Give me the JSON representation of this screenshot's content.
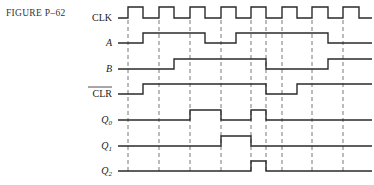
{
  "figure": {
    "label": "FIGURE P–62"
  },
  "diagram": {
    "type": "timing_diagram",
    "x_start": 118,
    "x_end": 372,
    "clock_rising_edges": [
      128,
      159,
      190,
      221,
      251,
      282,
      312,
      343
    ],
    "clock_falling_edges": [
      143,
      174,
      205,
      236,
      266,
      297,
      328,
      359
    ],
    "dashed_guides_x": [
      128,
      159,
      190,
      221,
      251,
      266,
      282,
      312,
      343
    ],
    "signals": [
      {
        "name": "CLK",
        "italic": false,
        "overline": false,
        "y_low": 18,
        "y_high": 7,
        "initial": 0,
        "transitions": [
          128,
          143,
          159,
          174,
          190,
          205,
          221,
          236,
          251,
          266,
          282,
          297,
          312,
          328,
          343,
          359
        ]
      },
      {
        "name": "A",
        "italic": true,
        "overline": false,
        "y_low": 43,
        "y_high": 33,
        "initial": 0,
        "transitions": [
          143,
          205,
          236,
          328
        ]
      },
      {
        "name": "B",
        "italic": true,
        "overline": false,
        "y_low": 69,
        "y_high": 59,
        "initial": 0,
        "transitions": [
          174,
          266,
          328
        ]
      },
      {
        "name": "CLR",
        "italic": false,
        "overline": true,
        "y_low": 94,
        "y_high": 84,
        "initial": 0,
        "transitions": [
          143,
          266,
          297
        ]
      },
      {
        "name": "Q",
        "sub": "0",
        "italic": true,
        "overline": false,
        "y_low": 120,
        "y_high": 110,
        "initial": 0,
        "transitions": [
          190,
          221,
          251,
          266
        ]
      },
      {
        "name": "Q",
        "sub": "1",
        "italic": true,
        "overline": false,
        "y_low": 146,
        "y_high": 136,
        "initial": 0,
        "transitions": [
          221,
          251
        ]
      },
      {
        "name": "Q",
        "sub": "2",
        "italic": true,
        "overline": false,
        "y_low": 171,
        "y_high": 161,
        "initial": 0,
        "transitions": [
          251,
          266
        ]
      }
    ]
  }
}
